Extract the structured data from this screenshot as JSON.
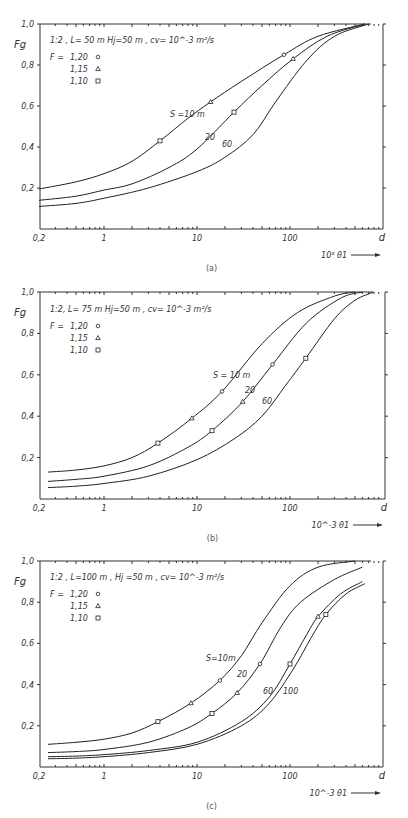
{
  "chart_data": [
    {
      "type": "line",
      "panel": "(a)",
      "title": "1:2 , L= 50 m  Hj=50 m , cv= 10^-3 m²/s",
      "xlabel": "10³ θ1",
      "x_end_label": "d",
      "ylabel": "Fg",
      "xscale": "log",
      "xlim": [
        0.2,
        1000
      ],
      "ylim": [
        0,
        1.0
      ],
      "xticks": [
        "0,2",
        "1",
        "10",
        "100"
      ],
      "yticks": [
        "0,2",
        "0,4",
        "0,6",
        "0,8",
        "1,0"
      ],
      "legend": {
        "header": "F =",
        "entries": [
          {
            "value": "1,20",
            "marker": "circle"
          },
          {
            "value": "1,15",
            "marker": "triangle"
          },
          {
            "value": "1,10",
            "marker": "square"
          }
        ]
      },
      "series": [
        {
          "name": "S=10 m",
          "label": "S =10 m",
          "x": [
            0.2,
            0.5,
            1,
            2,
            4,
            8,
            14,
            30,
            86,
            200,
            640
          ],
          "y": [
            0.195,
            0.23,
            0.27,
            0.33,
            0.43,
            0.54,
            0.62,
            0.72,
            0.85,
            0.94,
            1.0
          ],
          "markers": [
            {
              "x": 4,
              "y": 0.43,
              "m": "square"
            },
            {
              "x": 14,
              "y": 0.62,
              "m": "triangle"
            },
            {
              "x": 86,
              "y": 0.85,
              "m": "circle"
            }
          ]
        },
        {
          "name": "S=20 m",
          "label": "20",
          "x": [
            0.2,
            0.5,
            1,
            2,
            5,
            10,
            25,
            50,
            108,
            250,
            640
          ],
          "y": [
            0.14,
            0.16,
            0.19,
            0.22,
            0.3,
            0.39,
            0.57,
            0.7,
            0.83,
            0.94,
            1.0
          ],
          "markers": [
            {
              "x": 25,
              "y": 0.57,
              "m": "square"
            },
            {
              "x": 108,
              "y": 0.83,
              "m": "triangle"
            }
          ]
        },
        {
          "name": "S=60 m",
          "label": "60",
          "x": [
            0.2,
            0.5,
            1,
            3,
            10,
            20,
            40,
            70,
            150,
            300,
            700
          ],
          "y": [
            0.11,
            0.125,
            0.15,
            0.2,
            0.28,
            0.35,
            0.46,
            0.62,
            0.82,
            0.94,
            1.0
          ],
          "markers": []
        }
      ],
      "caption": "(a)"
    },
    {
      "type": "line",
      "panel": "(b)",
      "title": "1:2,  L= 75 m   Hj=50 m , cv= 10^-3 m²/s",
      "xlabel": "10^-3 θ1",
      "x_end_label": "d",
      "ylabel": "Fg",
      "xscale": "log",
      "xlim": [
        0.2,
        1000
      ],
      "ylim": [
        0,
        1.0
      ],
      "xticks": [
        "0,2",
        "1",
        "10",
        "100"
      ],
      "yticks": [
        "0,2",
        "0,4",
        "0,6",
        "0,8",
        "1,0"
      ],
      "legend": {
        "header": "F =",
        "entries": [
          {
            "value": "1,20",
            "marker": "circle"
          },
          {
            "value": "1,15",
            "marker": "triangle"
          },
          {
            "value": "1,10",
            "marker": "square"
          }
        ]
      },
      "series": [
        {
          "name": "S=10 m",
          "label": "S = 10 m",
          "x": [
            0.25,
            0.5,
            1,
            2,
            3.8,
            8.8,
            18.6,
            50,
            120,
            300,
            500
          ],
          "y": [
            0.13,
            0.14,
            0.16,
            0.2,
            0.27,
            0.39,
            0.52,
            0.75,
            0.9,
            0.98,
            1.0
          ],
          "markers": [
            {
              "x": 3.8,
              "y": 0.27,
              "m": "square"
            },
            {
              "x": 8.8,
              "y": 0.39,
              "m": "triangle"
            },
            {
              "x": 18.6,
              "y": 0.52,
              "m": "circle"
            }
          ]
        },
        {
          "name": "S=20 m",
          "label": "20",
          "x": [
            0.25,
            0.5,
            1,
            3,
            8,
            14.5,
            31,
            65,
            150,
            350,
            600
          ],
          "y": [
            0.085,
            0.095,
            0.11,
            0.16,
            0.25,
            0.33,
            0.47,
            0.65,
            0.85,
            0.97,
            1.0
          ],
          "markers": [
            {
              "x": 14.5,
              "y": 0.33,
              "m": "square"
            },
            {
              "x": 31,
              "y": 0.47,
              "m": "triangle"
            },
            {
              "x": 65,
              "y": 0.65,
              "m": "circle"
            }
          ]
        },
        {
          "name": "S=60 m",
          "label": "60",
          "x": [
            0.25,
            0.5,
            1,
            3,
            10,
            25,
            50,
            90,
            148,
            300,
            500,
            800
          ],
          "y": [
            0.055,
            0.062,
            0.075,
            0.11,
            0.19,
            0.29,
            0.4,
            0.55,
            0.68,
            0.87,
            0.96,
            1.0
          ],
          "markers": [
            {
              "x": 148,
              "y": 0.68,
              "m": "square"
            }
          ]
        }
      ],
      "caption": "(b)"
    },
    {
      "type": "line",
      "panel": "(c)",
      "title": "1:2 , L=100 m ,  Hj =50 m , cv= 10^-3 m²/s",
      "xlabel": "10^-3 θ1",
      "x_end_label": "d",
      "ylabel": "Fg",
      "xscale": "log",
      "xlim": [
        0.2,
        1000
      ],
      "ylim": [
        0,
        1.0
      ],
      "xticks": [
        "0,2",
        "1",
        "10",
        "100"
      ],
      "yticks": [
        "0,2",
        "0,4",
        "0,6",
        "0,8",
        "1,0"
      ],
      "legend": {
        "header": "F =",
        "entries": [
          {
            "value": "1,20",
            "marker": "circle"
          },
          {
            "value": "1,15",
            "marker": "triangle"
          },
          {
            "value": "1,10",
            "marker": "square"
          }
        ]
      },
      "series": [
        {
          "name": "S=10 m",
          "label": "S=10m",
          "x": [
            0.25,
            0.5,
            1,
            2,
            3.8,
            8.6,
            17.6,
            30,
            50,
            100,
            200,
            500
          ],
          "y": [
            0.11,
            0.12,
            0.135,
            0.165,
            0.22,
            0.31,
            0.42,
            0.54,
            0.7,
            0.88,
            0.97,
            1.0
          ],
          "markers": [
            {
              "x": 3.8,
              "y": 0.22,
              "m": "square"
            },
            {
              "x": 8.6,
              "y": 0.31,
              "m": "triangle"
            },
            {
              "x": 17.6,
              "y": 0.42,
              "m": "circle"
            }
          ]
        },
        {
          "name": "S=20 m",
          "label": "20",
          "x": [
            0.25,
            0.5,
            1,
            3,
            8,
            14.5,
            27,
            47.5,
            80,
            130,
            300,
            600
          ],
          "y": [
            0.07,
            0.075,
            0.085,
            0.12,
            0.19,
            0.26,
            0.36,
            0.5,
            0.68,
            0.8,
            0.91,
            0.97
          ],
          "markers": [
            {
              "x": 14.5,
              "y": 0.26,
              "m": "square"
            },
            {
              "x": 27,
              "y": 0.36,
              "m": "triangle"
            },
            {
              "x": 47.5,
              "y": 0.5,
              "m": "circle"
            }
          ]
        },
        {
          "name": "S=60 m",
          "label": "60",
          "x": [
            0.25,
            0.5,
            1,
            3,
            10,
            30,
            60,
            100,
            150,
            200,
            350,
            600
          ],
          "y": [
            0.05,
            0.053,
            0.06,
            0.08,
            0.12,
            0.22,
            0.34,
            0.5,
            0.64,
            0.73,
            0.84,
            0.9
          ],
          "markers": [
            {
              "x": 100,
              "y": 0.5,
              "m": "square"
            },
            {
              "x": 200,
              "y": 0.73,
              "m": "triangle"
            }
          ]
        },
        {
          "name": "S=100 m",
          "label": "100",
          "x": [
            0.25,
            0.5,
            1,
            3,
            10,
            30,
            60,
            110,
            170,
            243,
            400,
            640
          ],
          "y": [
            0.04,
            0.043,
            0.05,
            0.07,
            0.11,
            0.2,
            0.31,
            0.48,
            0.63,
            0.74,
            0.84,
            0.89
          ],
          "markers": [
            {
              "x": 243,
              "y": 0.74,
              "m": "square"
            }
          ]
        }
      ],
      "caption": "(c)"
    }
  ],
  "panels_layout": [
    {
      "x0": 40,
      "x1": 383,
      "xone": 104,
      "decade": 93,
      "ytop": 24,
      "ybot": 229,
      "title_y": 43,
      "series_labels": [
        {
          "x": 170,
          "y": 117
        },
        {
          "x": 205,
          "y": 140
        },
        {
          "x": 222,
          "y": 147
        }
      ]
    },
    {
      "x0": 40,
      "x1": 385,
      "xone": 104,
      "decade": 93,
      "ytop": 292,
      "ybot": 499,
      "title_y": 312,
      "series_labels": [
        {
          "x": 213,
          "y": 378
        },
        {
          "x": 245,
          "y": 393
        },
        {
          "x": 262,
          "y": 404
        }
      ]
    },
    {
      "x0": 40,
      "x1": 383,
      "xone": 104,
      "decade": 93,
      "ytop": 561,
      "ybot": 767,
      "title_y": 580,
      "series_labels": [
        {
          "x": 206,
          "y": 661
        },
        {
          "x": 237,
          "y": 677
        },
        {
          "x": 263,
          "y": 694
        },
        {
          "x": 283,
          "y": 694
        }
      ]
    }
  ]
}
